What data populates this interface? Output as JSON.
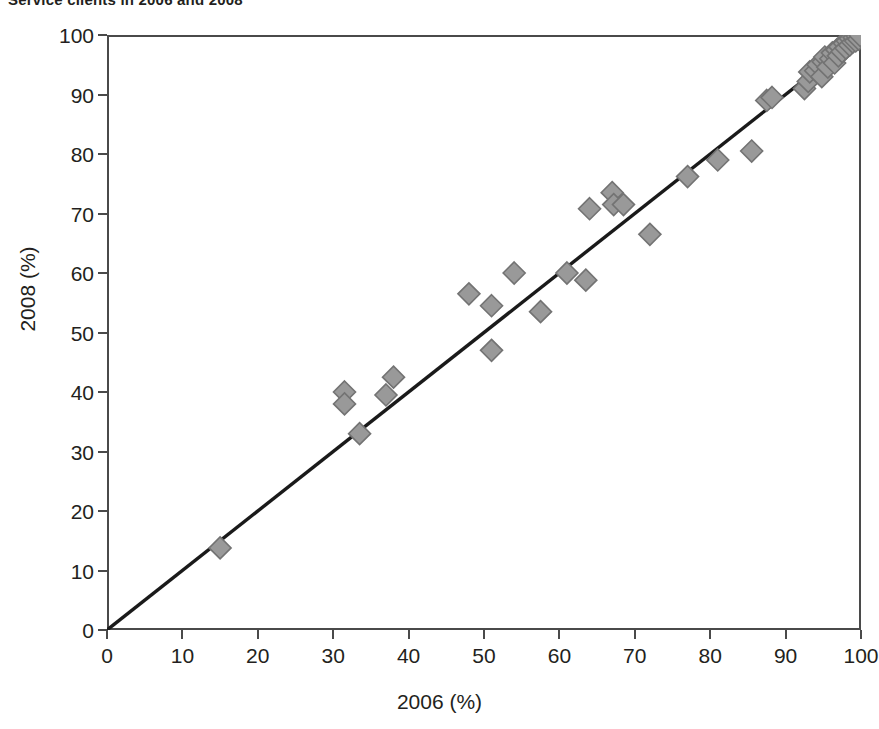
{
  "title": "Service clients in 2006 and 2008",
  "axes": {
    "x_label": "2006 (%)",
    "y_label": "2008 (%)",
    "x_ticks": [
      "0",
      "10",
      "20",
      "30",
      "40",
      "50",
      "60",
      "70",
      "80",
      "90",
      "100"
    ],
    "y_ticks": [
      "100",
      "90",
      "80",
      "70",
      "60",
      "50",
      "40",
      "30",
      "20",
      "10",
      "0"
    ]
  },
  "colors": {
    "marker_fill": "#999999",
    "marker_stroke": "#737373",
    "axis": "#4a4a4a",
    "reference_line": "#1a1a1a",
    "text": "#231f20",
    "background": "#ffffff"
  },
  "chart_data": {
    "type": "scatter",
    "title": "Service clients in 2006 and 2008",
    "xlabel": "2006 (%)",
    "ylabel": "2008 (%)",
    "xlim": [
      0,
      100
    ],
    "ylim": [
      0,
      100
    ],
    "xticks": [
      0,
      10,
      20,
      30,
      40,
      50,
      60,
      70,
      80,
      90,
      100
    ],
    "yticks": [
      0,
      10,
      20,
      30,
      40,
      50,
      60,
      70,
      80,
      90,
      100
    ],
    "grid": false,
    "legend": "none",
    "marker": "diamond",
    "marker_size": 11,
    "reference_line": {
      "type": "identity",
      "label": "y = x",
      "from": [
        0,
        0
      ],
      "to": [
        100,
        100
      ]
    },
    "series": [
      {
        "name": "Countries",
        "points": [
          [
            15.0,
            13.8
          ],
          [
            31.5,
            40.0
          ],
          [
            31.5,
            38.0
          ],
          [
            33.5,
            33.0
          ],
          [
            37.0,
            39.5
          ],
          [
            38.0,
            42.5
          ],
          [
            48.0,
            56.5
          ],
          [
            51.0,
            54.5
          ],
          [
            51.0,
            47.0
          ],
          [
            54.0,
            60.0
          ],
          [
            57.5,
            53.5
          ],
          [
            61.0,
            60.0
          ],
          [
            63.5,
            58.8
          ],
          [
            64.0,
            70.8
          ],
          [
            67.0,
            73.5
          ],
          [
            67.2,
            71.5
          ],
          [
            68.5,
            71.5
          ],
          [
            72.0,
            66.5
          ],
          [
            77.0,
            76.2
          ],
          [
            81.0,
            79.0
          ],
          [
            85.5,
            80.5
          ],
          [
            87.5,
            89.0
          ],
          [
            88.2,
            89.5
          ],
          [
            92.5,
            91.0
          ],
          [
            93.0,
            92.2
          ],
          [
            93.2,
            93.8
          ],
          [
            94.0,
            94.0
          ],
          [
            94.3,
            95.0
          ],
          [
            94.8,
            93.0
          ],
          [
            95.0,
            95.5
          ],
          [
            95.2,
            96.3
          ],
          [
            95.6,
            94.6
          ],
          [
            96.0,
            96.0
          ],
          [
            96.2,
            97.0
          ],
          [
            96.5,
            95.3
          ],
          [
            96.8,
            97.5
          ],
          [
            97.0,
            96.5
          ],
          [
            97.2,
            98.0
          ],
          [
            97.5,
            97.2
          ],
          [
            97.8,
            98.6
          ],
          [
            98.0,
            97.8
          ],
          [
            98.2,
            99.0
          ],
          [
            98.5,
            98.3
          ],
          [
            98.6,
            99.4
          ],
          [
            98.9,
            98.8
          ],
          [
            99.1,
            99.6
          ],
          [
            99.3,
            99.0
          ],
          [
            99.5,
            99.8
          ],
          [
            99.7,
            99.3
          ],
          [
            99.9,
            99.9
          ]
        ]
      }
    ]
  }
}
